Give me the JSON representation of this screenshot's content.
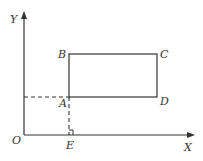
{
  "diagram": {
    "type": "coordinate-geometry",
    "axes": {
      "x_label": "X",
      "y_label": "Y",
      "origin_label": "O"
    },
    "rectangle": {
      "vertices": [
        "A",
        "B",
        "C",
        "D"
      ],
      "labels": {
        "A": "A",
        "B": "B",
        "C": "C",
        "D": "D"
      }
    },
    "foot_point": {
      "label": "E",
      "note": "perpendicular from A to X axis (right angle mark)"
    },
    "colors": {
      "line": "#333333",
      "background": "#ffffff"
    }
  }
}
